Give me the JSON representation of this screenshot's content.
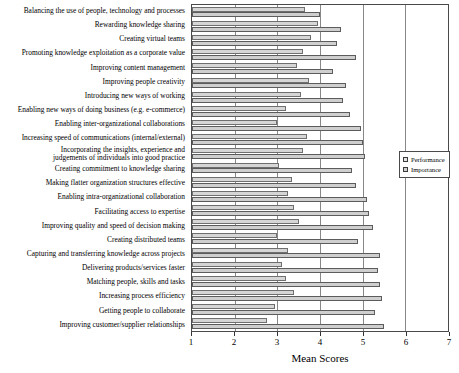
{
  "chart_data": {
    "type": "bar",
    "orientation": "horizontal",
    "title": "",
    "xlabel": "Mean Scores",
    "ylabel": "",
    "xlim": [
      1,
      7
    ],
    "xticks": [
      1,
      2,
      3,
      4,
      5,
      6,
      7
    ],
    "grid": true,
    "legend_position": "right",
    "categories": [
      "Balancing the use of people, technology and processes",
      "Rewarding knowledge sharing",
      "Creating virtual teams",
      "Promoting knowledge exploitation as a corporate value",
      "Improving content management",
      "Improving people creativity",
      "Introducing new ways of working",
      "Enabling new ways of doing business (e.g. e-commerce)",
      "Enabling inter-organizational collaborations",
      "Increasing speed of communications (internal/external)",
      "Incorporating the insights, experience and\njudgements of individuals into good practice",
      "Creating commitment to knowledge sharing",
      "Making flatter organization structures effective",
      "Enabling intra-organizational collaboration",
      "Facilitating access to expertise",
      "Improving quality and speed of decision making",
      "Creating distributed teams",
      "Capturing and transferring knowledge across projects",
      "Delivering products/services faster",
      "Matching people, skills and tasks",
      "Increasing process efficiency",
      "Getting people to collaborate",
      "Improving customer/supplier relationships"
    ],
    "series": [
      {
        "name": "Performance",
        "color": "#d6d6d6",
        "values": [
          3.65,
          3.95,
          3.8,
          3.6,
          3.45,
          3.75,
          3.55,
          3.2,
          3.0,
          3.7,
          3.6,
          3.05,
          3.35,
          3.25,
          3.4,
          3.5,
          3.0,
          3.25,
          3.1,
          3.2,
          3.4,
          2.95,
          2.75
        ]
      },
      {
        "name": "Importance",
        "color": "#cfcfcf",
        "values": [
          4.0,
          4.5,
          4.4,
          4.85,
          4.3,
          4.6,
          4.55,
          4.7,
          4.95,
          5.0,
          5.05,
          4.75,
          4.85,
          5.1,
          5.15,
          5.25,
          4.9,
          5.4,
          5.35,
          5.4,
          5.45,
          5.3,
          5.5
        ]
      }
    ]
  },
  "legend": {
    "items": [
      {
        "label": "Performance"
      },
      {
        "label": "Importance"
      }
    ]
  }
}
